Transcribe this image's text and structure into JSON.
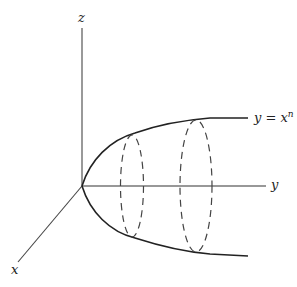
{
  "diagram": {
    "axes": {
      "z_label": "z",
      "y_label": "y",
      "x_label": "x"
    },
    "curve": {
      "label_base": "y = x",
      "label_exp": "n"
    }
  },
  "colors": {
    "stroke": "#222222",
    "dashed": "#444444"
  }
}
